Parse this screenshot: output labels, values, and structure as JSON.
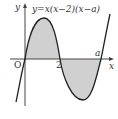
{
  "diagram": {
    "equation": "y=x(x−2)(x−a)",
    "axis_labels": {
      "x": "x",
      "y": "y"
    },
    "origin_label": "O",
    "tick_labels": {
      "two": "2",
      "a": "a"
    },
    "colors": {
      "curve": "#222222",
      "axis": "#444444",
      "shade": "#d0d0d0",
      "text": "#333333"
    },
    "regions": [
      {
        "name": "area-0-to-2",
        "description": "shaded region above x-axis between 0 and 2"
      },
      {
        "name": "area-2-to-a",
        "description": "shaded region below x-axis between 2 and a"
      }
    ]
  }
}
